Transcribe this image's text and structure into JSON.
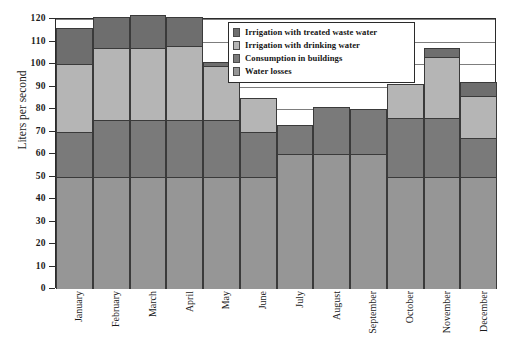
{
  "chart_data": {
    "type": "bar",
    "stacked": true,
    "title": "",
    "xlabel": "",
    "ylabel": "Liters per second",
    "ylim": [
      0,
      120
    ],
    "ytick_step": 10,
    "yticks": [
      0,
      10,
      20,
      30,
      40,
      50,
      60,
      70,
      80,
      90,
      100,
      110,
      120
    ],
    "ytick_labels": [
      "0",
      "10",
      "20",
      "30",
      "40",
      "50",
      "60",
      "70",
      "80",
      "90",
      "100",
      "110",
      "120"
    ],
    "grid": true,
    "legend_position": "top-center",
    "categories": [
      "January",
      "February",
      "March",
      "April",
      "May",
      "June",
      "July",
      "August",
      "September",
      "October",
      "November",
      "December"
    ],
    "series": [
      {
        "name": "Water losses",
        "color": "#969696",
        "values": [
          50,
          50,
          50,
          50,
          50,
          50,
          60,
          60,
          60,
          50,
          50,
          50
        ]
      },
      {
        "name": "Consumption in buildings",
        "color": "#7a7a7a",
        "values": [
          20,
          25,
          25,
          25,
          25,
          20,
          13,
          21,
          20,
          26,
          26,
          17
        ]
      },
      {
        "name": "Irrigation with drinking water",
        "color": "#b5b5b5",
        "values": [
          30,
          32,
          32,
          33,
          24,
          15,
          0,
          0,
          0,
          15,
          27,
          19
        ]
      },
      {
        "name": "Irrigation with treated waste water",
        "color": "#6e6e6e",
        "values": [
          16,
          14,
          15,
          13,
          2,
          0,
          0,
          0,
          0,
          0,
          4,
          6
        ]
      }
    ],
    "totals": [
      116,
      121,
      122,
      121,
      101,
      85,
      73,
      81,
      80,
      91,
      107,
      92
    ]
  },
  "legend": {
    "items": [
      {
        "label": "Irrigation with treated waste water",
        "color": "#6e6e6e"
      },
      {
        "label": "Irrigation with drinking water",
        "color": "#b5b5b5"
      },
      {
        "label": "Consumption in buildings",
        "color": "#7a7a7a"
      },
      {
        "label": "Water losses",
        "color": "#969696"
      }
    ]
  },
  "axes": {
    "y_title": "Liters per second"
  },
  "colors": {
    "frame": "#2b2b2b",
    "gridline": "#7d7d7d",
    "bar_outline": "#3a3a3a",
    "background": "#ffffff"
  }
}
